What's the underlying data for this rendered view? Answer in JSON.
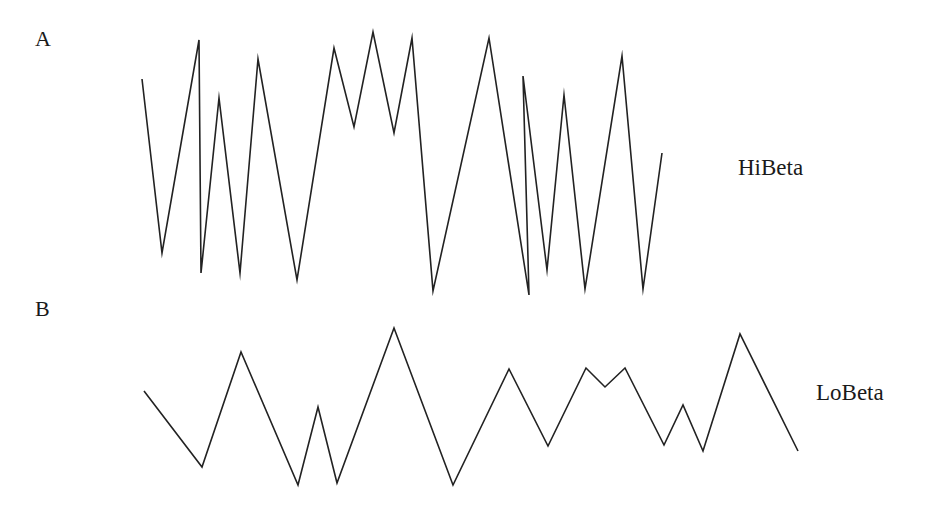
{
  "figure": {
    "panels": [
      {
        "id": "A",
        "panel_label": "A",
        "trace_label": "HiBeta"
      },
      {
        "id": "B",
        "panel_label": "B",
        "trace_label": "LoBeta"
      }
    ],
    "line_color": "#222222",
    "background": "#ffffff"
  },
  "chart_data": [
    {
      "type": "line",
      "title": "A",
      "series": [
        {
          "name": "HiBeta",
          "points_px": [
            [
              142,
              79
            ],
            [
              162,
              253
            ],
            [
              199,
              40
            ],
            [
              201,
              273
            ],
            [
              219,
              98
            ],
            [
              240,
              273
            ],
            [
              258,
              59
            ],
            [
              297,
              280
            ],
            [
              334,
              48
            ],
            [
              354,
              127
            ],
            [
              373,
              32
            ],
            [
              394,
              133
            ],
            [
              412,
              38
            ],
            [
              433,
              291
            ],
            [
              489,
              38
            ],
            [
              529,
              295
            ],
            [
              523,
              76
            ],
            [
              547,
              270
            ],
            [
              564,
              95
            ],
            [
              585,
              289
            ],
            [
              622,
              56
            ],
            [
              643,
              289
            ],
            [
              662,
              153
            ]
          ]
        }
      ],
      "xlabel": "",
      "ylabel": "",
      "axes": "none",
      "grid": false,
      "legend": "text label at right of trace"
    },
    {
      "type": "line",
      "title": "B",
      "series": [
        {
          "name": "LoBeta",
          "points_px": [
            [
              144,
              391
            ],
            [
              202,
              467
            ],
            [
              241,
              352
            ],
            [
              298,
              485
            ],
            [
              318,
              407
            ],
            [
              337,
              483
            ],
            [
              394,
              328
            ],
            [
              453,
              485
            ],
            [
              509,
              369
            ],
            [
              548,
              446
            ],
            [
              586,
              368
            ],
            [
              605,
              387
            ],
            [
              625,
              368
            ],
            [
              664,
              445
            ],
            [
              683,
              405
            ],
            [
              703,
              451
            ],
            [
              740,
              334
            ],
            [
              798,
              451
            ]
          ]
        }
      ],
      "xlabel": "",
      "ylabel": "",
      "axes": "none",
      "grid": false,
      "legend": "text label at right of trace"
    }
  ]
}
